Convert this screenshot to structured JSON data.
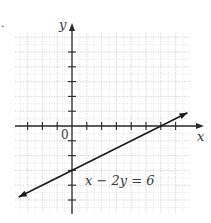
{
  "figure": {
    "corner_mark": ".",
    "axes": {
      "x_label": "x",
      "y_label": "y",
      "origin_label": "0"
    },
    "equation_label": "x − 2y = 6"
  },
  "chart_data": {
    "type": "line",
    "title": "",
    "xlabel": "x",
    "ylabel": "y",
    "xlim": [
      -3.8,
      8
    ],
    "ylim": [
      -5.8,
      6.3
    ],
    "grid": true,
    "x_ticks": [
      -3,
      -2,
      -1,
      1,
      2,
      3,
      4,
      5,
      6,
      7
    ],
    "y_ticks": [
      -5,
      -4,
      -3,
      -2,
      -1,
      1,
      2,
      3,
      4,
      5
    ],
    "series": [
      {
        "name": "x − 2y = 6",
        "equation": "x - 2y = 6",
        "slope": 0.5,
        "y_intercept": -3,
        "x_intercept": 6,
        "points": [
          [
            -3.6,
            -4.8
          ],
          [
            0,
            -3
          ],
          [
            6,
            0
          ],
          [
            7.8,
            0.9
          ]
        ],
        "arrows": "both ends"
      }
    ],
    "annotations": [
      {
        "text": "x − 2y = 6",
        "x": 1,
        "y": -3.6
      },
      {
        "text": "0",
        "x": -0.4,
        "y": -0.5
      }
    ],
    "colors": {
      "line": "#1a1a1a",
      "axis": "#2a2a2a",
      "grid": "#c8c8c8",
      "background": "#ffffff"
    }
  }
}
